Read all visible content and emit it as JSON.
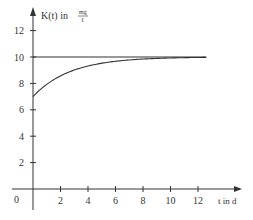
{
  "chart_data": {
    "type": "line",
    "title": "",
    "xlabel": "t in d",
    "ylabel": "K(t) in mg/ℓ",
    "ylabel_main": "K(t) in",
    "ylabel_unit_num": "mg",
    "ylabel_unit_den": "ℓ",
    "xlim": [
      0,
      13.5
    ],
    "ylim": [
      0,
      13.5
    ],
    "x_ticks": [
      2,
      4,
      6,
      8,
      10,
      12
    ],
    "y_ticks": [
      2,
      4,
      6,
      8,
      10,
      12
    ],
    "origin_label": "0",
    "grid": false,
    "series": [
      {
        "name": "K(t)",
        "kind": "curve",
        "x": [
          0,
          0.5,
          1,
          1.5,
          2,
          3,
          4,
          5,
          6,
          7,
          8,
          9,
          10,
          11,
          12,
          12.6
        ],
        "y": [
          7.0,
          7.5,
          7.9,
          8.2,
          8.5,
          8.9,
          9.2,
          9.4,
          9.55,
          9.65,
          9.72,
          9.78,
          9.83,
          9.87,
          9.9,
          9.92
        ]
      },
      {
        "name": "asymptote",
        "kind": "horizontal",
        "x": [
          0,
          12.6
        ],
        "y": [
          10,
          10
        ]
      }
    ]
  }
}
